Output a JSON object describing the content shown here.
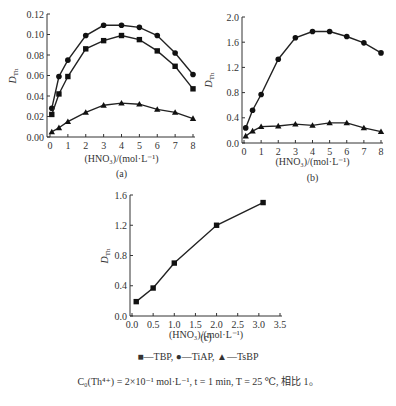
{
  "chart_data": [
    {
      "id": "a",
      "type": "line",
      "caption": "(a)",
      "xlabel": "(HNO₃)/(mol·L⁻¹)",
      "ylabel": "D_Th",
      "xlim": [
        0,
        8
      ],
      "ylim": [
        0,
        0.12
      ],
      "xticks": [
        0,
        1,
        2,
        3,
        4,
        5,
        6,
        7,
        8
      ],
      "yticks": [
        "0.00",
        "0.02",
        "0.04",
        "0.06",
        "0.08",
        "0.10",
        "0.12"
      ],
      "x": [
        0.1,
        0.5,
        1,
        2,
        3,
        4,
        5,
        6,
        7,
        8
      ],
      "series": [
        {
          "name": "TiAP",
          "marker": "circle",
          "values": [
            0.028,
            0.059,
            0.075,
            0.099,
            0.109,
            0.109,
            0.107,
            0.099,
            0.082,
            0.061
          ]
        },
        {
          "name": "TBP",
          "marker": "square",
          "values": [
            0.022,
            0.042,
            0.059,
            0.086,
            0.094,
            0.099,
            0.095,
            0.084,
            0.069,
            0.047
          ]
        },
        {
          "name": "TsBP",
          "marker": "triangle",
          "values": [
            0.005,
            0.009,
            0.015,
            0.024,
            0.031,
            0.033,
            0.032,
            0.027,
            0.024,
            0.018
          ]
        }
      ]
    },
    {
      "id": "b",
      "type": "line",
      "caption": "(b)",
      "xlabel": "(HNO₃)/(mol·L⁻¹)",
      "ylabel": "D_Th",
      "xlim": [
        0,
        8
      ],
      "ylim": [
        0,
        2.0
      ],
      "xticks": [
        0,
        1,
        2,
        3,
        4,
        5,
        6,
        7,
        8
      ],
      "yticks": [
        "0.0",
        "0.4",
        "0.8",
        "1.2",
        "1.6",
        "2.0"
      ],
      "x": [
        0.1,
        0.5,
        1,
        2,
        3,
        4,
        5,
        6,
        7,
        8
      ],
      "series": [
        {
          "name": "TiAP",
          "marker": "circle",
          "values": [
            0.24,
            0.52,
            0.77,
            1.33,
            1.67,
            1.77,
            1.77,
            1.69,
            1.59,
            1.43
          ]
        },
        {
          "name": "TsBP",
          "marker": "triangle",
          "values": [
            0.11,
            0.19,
            0.26,
            0.27,
            0.3,
            0.28,
            0.32,
            0.32,
            0.24,
            0.18
          ]
        }
      ]
    },
    {
      "id": "c",
      "type": "line",
      "caption": "(c)",
      "xlabel": "(HNO₃)/(mol·L⁻¹)",
      "ylabel": "D_Th",
      "xlim": [
        0,
        3.5
      ],
      "ylim": [
        0,
        1.6
      ],
      "xticks": [
        "0.0",
        "0.5",
        "1.0",
        "1.5",
        "2.0",
        "2.5",
        "3.0",
        "3.5"
      ],
      "yticks": [
        "0.0",
        "0.4",
        "0.8",
        "1.2",
        "1.6"
      ],
      "x": [
        0.1,
        0.5,
        1.0,
        2.0,
        3.1
      ],
      "series": [
        {
          "name": "TBP",
          "marker": "square",
          "values": [
            0.19,
            0.37,
            0.7,
            1.2,
            1.5
          ]
        }
      ]
    }
  ],
  "legend": {
    "items": [
      {
        "symbol": "■",
        "label": "—TBP"
      },
      {
        "symbol": "●",
        "label": "—TiAP"
      },
      {
        "symbol": "▲",
        "label": "—TsBP"
      }
    ],
    "separator": ", "
  },
  "conditions": "C₀(Th⁴⁺) = 2×10⁻¹ mol·L⁻¹, t = 1 min, T = 25 ℃, 相比 1。"
}
